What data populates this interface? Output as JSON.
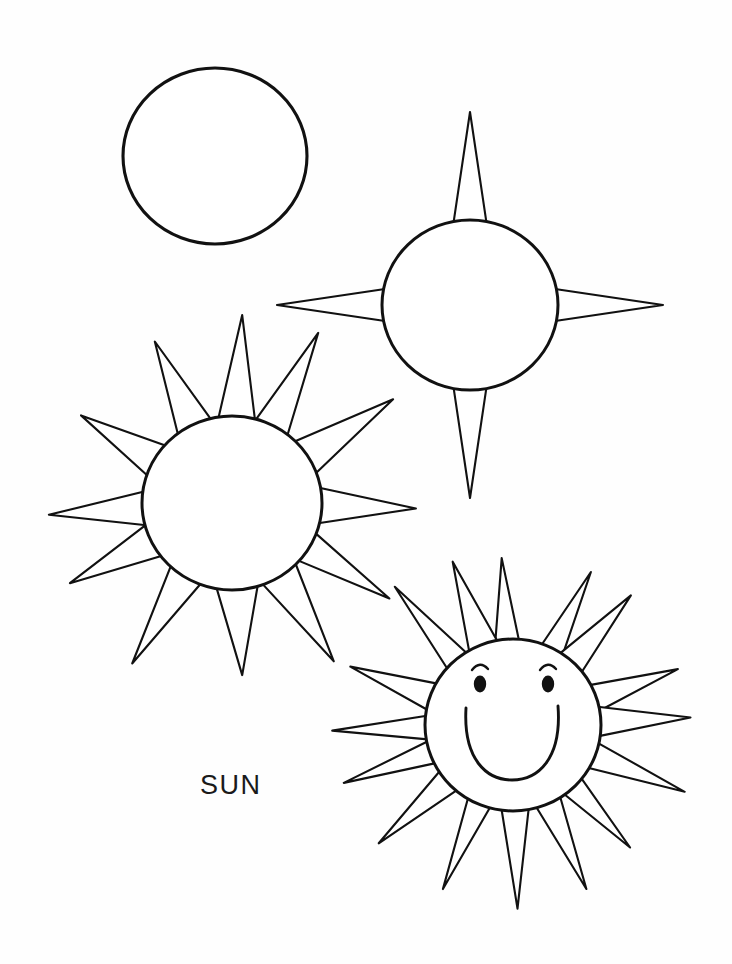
{
  "page": {
    "title": "SUN",
    "background_color": "#fefefe",
    "ink_color": "#111111",
    "width": 732,
    "height": 964,
    "media": "line-art drawing tutorial"
  },
  "caption": {
    "text": "SUN",
    "x": 200,
    "y": 772,
    "font_size": 27
  },
  "steps": [
    {
      "index": 1,
      "name": "plain-circle",
      "label": "Step 1 - draw a circle",
      "circle": {
        "cx": 215,
        "cy": 156,
        "rx": 92,
        "ry": 88
      },
      "ray_count": 0,
      "has_face": false
    },
    {
      "index": 2,
      "name": "four-rays",
      "label": "Step 2 - add four long rays",
      "circle": {
        "cx": 470,
        "cy": 305,
        "rx": 88,
        "ry": 85
      },
      "ray_count": 4,
      "ray_angles_deg": [
        270,
        0,
        90,
        180
      ],
      "ray_length": 105,
      "ray_half_width_deg": 11,
      "has_face": false
    },
    {
      "index": 3,
      "name": "twelve-rays",
      "label": "Step 3 - fill in more rays all around",
      "circle": {
        "cx": 232,
        "cy": 503,
        "rx": 90,
        "ry": 87
      },
      "ray_count": 12,
      "ray_length": 92,
      "ray_half_width_deg": 12,
      "has_face": false
    },
    {
      "index": 4,
      "name": "finished-sun-with-face",
      "label": "Step 4 - add a smiling face",
      "circle": {
        "cx": 513,
        "cy": 725,
        "rx": 88,
        "ry": 86
      },
      "ray_count": 16,
      "ray_length": 88,
      "ray_half_width_deg": 9,
      "has_face": true,
      "face": {
        "left_eye": {
          "cx": 480,
          "cy": 683,
          "rx": 6,
          "ry": 8
        },
        "right_eye": {
          "cx": 548,
          "cy": 683,
          "rx": 6,
          "ry": 8
        },
        "left_brow": {
          "cx": 480,
          "cy": 667,
          "r": 9
        },
        "right_brow": {
          "cx": 548,
          "cy": 667,
          "r": 9
        },
        "smile": {
          "cx": 512,
          "cy": 728,
          "rx": 46,
          "ry": 48
        }
      }
    }
  ]
}
